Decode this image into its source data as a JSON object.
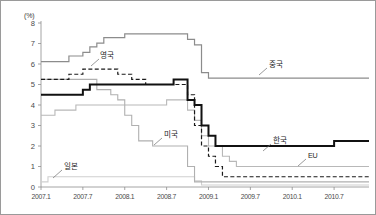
{
  "figure": {
    "unit_label": "(%)",
    "border_color": "#9a9a9a",
    "background": "#ffffff"
  },
  "chart_data": {
    "type": "line",
    "title": "",
    "subtitle": "",
    "xlabel": "",
    "ylabel": "(%)",
    "ylim": [
      0,
      8
    ],
    "yticks": [
      0,
      1,
      2,
      3,
      4,
      5,
      6,
      7,
      8
    ],
    "ytick_labels": [
      "0",
      "1",
      "2",
      "3",
      "4",
      "5",
      "6",
      "7",
      "8"
    ],
    "xlim": [
      "2007.1",
      "2010.12"
    ],
    "xticks": [
      "2007.1",
      "2007.7",
      "2008.1",
      "2008.7",
      "2009.1",
      "2009.7",
      "2010.1",
      "2010.7"
    ],
    "xtick_labels": [
      "2007.1",
      "2007.7",
      "2008.1",
      "2008.7",
      "2009.1",
      "2009.7",
      "2010.1",
      "2010.7"
    ],
    "grid": false,
    "legend": "inline-annotations",
    "interpolation": "step-post",
    "note": "Policy interest rates of major economies, monthly, Jan 2007 - Dec 2010",
    "series": [
      {
        "name": "중국",
        "label_en": "China",
        "color": "#8c8c8c",
        "width": 1.2,
        "dash": "none",
        "label_pos": {
          "x": 268,
          "y": 66
        },
        "leader": {
          "x1": 258,
          "y1": 74,
          "x2": 266,
          "y2": 67
        },
        "points": [
          {
            "x": "2007.1",
            "y": 6.12
          },
          {
            "x": "2007.4",
            "y": 6.12
          },
          {
            "x": "2007.5",
            "y": 6.39
          },
          {
            "x": "2007.7",
            "y": 6.57
          },
          {
            "x": "2007.8",
            "y": 6.84
          },
          {
            "x": "2007.9",
            "y": 7.02
          },
          {
            "x": "2007.10",
            "y": 7.29
          },
          {
            "x": "2007.12",
            "y": 7.29
          },
          {
            "x": "2008.1",
            "y": 7.47
          },
          {
            "x": "2008.9",
            "y": 7.47
          },
          {
            "x": "2008.10",
            "y": 7.2
          },
          {
            "x": "2008.11",
            "y": 6.93
          },
          {
            "x": "2008.12",
            "y": 5.58
          },
          {
            "x": "2009.1",
            "y": 5.31
          },
          {
            "x": "2010.12",
            "y": 5.31
          }
        ]
      },
      {
        "name": "영국",
        "label_en": "United Kingdom",
        "color": "#1a1a1a",
        "width": 1.2,
        "dash": "4,2.4",
        "label_pos": {
          "x": 99,
          "y": 57
        },
        "leader": {
          "x1": 90,
          "y1": 65,
          "x2": 98,
          "y2": 58
        },
        "points": [
          {
            "x": "2007.1",
            "y": 5.25
          },
          {
            "x": "2007.5",
            "y": 5.5
          },
          {
            "x": "2007.7",
            "y": 5.75
          },
          {
            "x": "2007.12",
            "y": 5.5
          },
          {
            "x": "2008.2",
            "y": 5.25
          },
          {
            "x": "2008.4",
            "y": 5.0
          },
          {
            "x": "2008.10",
            "y": 4.5
          },
          {
            "x": "2008.11",
            "y": 3.0
          },
          {
            "x": "2008.12",
            "y": 2.0
          },
          {
            "x": "2009.1",
            "y": 1.5
          },
          {
            "x": "2009.2",
            "y": 1.0
          },
          {
            "x": "2009.3",
            "y": 0.5
          },
          {
            "x": "2010.12",
            "y": 0.5
          }
        ]
      },
      {
        "name": "한국",
        "label_en": "Korea",
        "color": "#111111",
        "width": 2.0,
        "dash": "none",
        "label_pos": {
          "x": 272,
          "y": 142
        },
        "leader": {
          "x1": 262,
          "y1": 150,
          "x2": 270,
          "y2": 143
        },
        "points": [
          {
            "x": "2007.1",
            "y": 4.5
          },
          {
            "x": "2007.7",
            "y": 4.75
          },
          {
            "x": "2007.8",
            "y": 5.0
          },
          {
            "x": "2008.8",
            "y": 5.25
          },
          {
            "x": "2008.10",
            "y": 4.25
          },
          {
            "x": "2008.11",
            "y": 4.0
          },
          {
            "x": "2008.12",
            "y": 3.0
          },
          {
            "x": "2009.1",
            "y": 2.5
          },
          {
            "x": "2009.2",
            "y": 2.0
          },
          {
            "x": "2010.7",
            "y": 2.25
          },
          {
            "x": "2010.12",
            "y": 2.25
          }
        ]
      },
      {
        "name": "미국",
        "label_en": "United States",
        "color": "#b0b0b0",
        "width": 1.1,
        "dash": "none",
        "label_pos": {
          "x": 163,
          "y": 136
        },
        "leader": {
          "x1": 153,
          "y1": 144,
          "x2": 161,
          "y2": 137
        },
        "points": [
          {
            "x": "2007.1",
            "y": 5.25
          },
          {
            "x": "2007.9",
            "y": 4.75
          },
          {
            "x": "2007.11",
            "y": 4.5
          },
          {
            "x": "2007.12",
            "y": 4.25
          },
          {
            "x": "2008.1",
            "y": 3.5
          },
          {
            "x": "2008.2",
            "y": 3.0
          },
          {
            "x": "2008.3",
            "y": 2.25
          },
          {
            "x": "2008.5",
            "y": 2.0
          },
          {
            "x": "2008.10",
            "y": 1.0
          },
          {
            "x": "2008.11",
            "y": 0.25
          },
          {
            "x": "2010.12",
            "y": 0.25
          }
        ]
      },
      {
        "name": "EU",
        "label_en": "EU",
        "color": "#b8b8b8",
        "width": 1.1,
        "dash": "none",
        "label_pos": {
          "x": 307,
          "y": 157
        },
        "leader": {
          "x1": 297,
          "y1": 165,
          "x2": 305,
          "y2": 158
        },
        "points": [
          {
            "x": "2007.1",
            "y": 3.5
          },
          {
            "x": "2007.3",
            "y": 3.75
          },
          {
            "x": "2007.6",
            "y": 4.0
          },
          {
            "x": "2008.7",
            "y": 4.25
          },
          {
            "x": "2008.10",
            "y": 3.75
          },
          {
            "x": "2008.11",
            "y": 3.25
          },
          {
            "x": "2008.12",
            "y": 2.5
          },
          {
            "x": "2009.1",
            "y": 2.0
          },
          {
            "x": "2009.3",
            "y": 1.5
          },
          {
            "x": "2009.4",
            "y": 1.25
          },
          {
            "x": "2009.5",
            "y": 1.0
          },
          {
            "x": "2010.12",
            "y": 1.0
          }
        ]
      },
      {
        "name": "일본",
        "label_en": "Japan",
        "color": "#cfcfcf",
        "width": 1.1,
        "dash": "none",
        "label_pos": {
          "x": 63,
          "y": 168
        },
        "leader": {
          "x1": 52,
          "y1": 177,
          "x2": 61,
          "y2": 169
        },
        "points": [
          {
            "x": "2007.1",
            "y": 0.25
          },
          {
            "x": "2007.2",
            "y": 0.5
          },
          {
            "x": "2008.10",
            "y": 0.5
          },
          {
            "x": "2008.11",
            "y": 0.3
          },
          {
            "x": "2008.12",
            "y": 0.1
          },
          {
            "x": "2010.12",
            "y": 0.1
          }
        ]
      }
    ]
  }
}
